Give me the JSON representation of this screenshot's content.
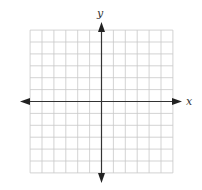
{
  "diagram": {
    "type": "coordinate-plane",
    "axes": {
      "x_label": "x",
      "y_label": "y"
    },
    "grid": {
      "columns": 12,
      "rows": 12,
      "cells_left_of_origin": 6,
      "cells_right_of_origin": 6,
      "cells_above_origin": 6,
      "cells_below_origin": 6
    },
    "colors": {
      "grid_line": "#c8c8c8",
      "axis": "#333333",
      "background": "#ffffff"
    }
  }
}
